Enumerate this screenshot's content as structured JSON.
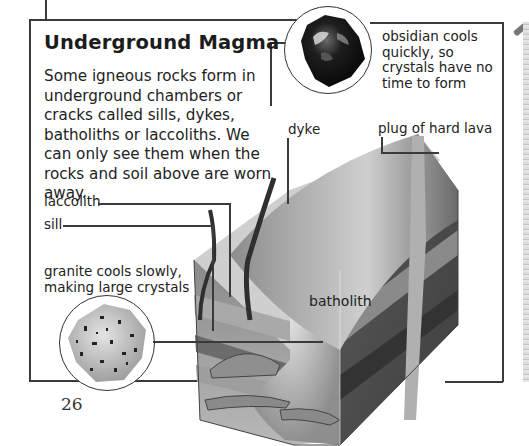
{
  "page": {
    "title": "Underground Magma",
    "intro": "Some igneous rocks form in underground chambers or cracks called sills, dykes, batholiths or laccoliths. We can only see them when the rocks and soil above are worn away.",
    "page_number": "26"
  },
  "specimens": {
    "obsidian": {
      "caption": "obsidian cools quickly, so crystals have no time to form",
      "icon": "obsidian-rock-photo"
    },
    "granite": {
      "caption": "granite cools slowly, making large crystals",
      "icon": "granite-rock-photo"
    }
  },
  "diagram": {
    "labels": {
      "dyke": "dyke",
      "plug": "plug of hard lava",
      "laccolith": "laccolith",
      "sill": "sill",
      "batholith": "batholith"
    }
  },
  "colors": {
    "frame": "#3a3a3a",
    "text": "#1c1c1c",
    "ground_top": "#c9c9c9",
    "rock_dark": "#4a4a4a",
    "magma_gray": "#9a9a9a"
  }
}
